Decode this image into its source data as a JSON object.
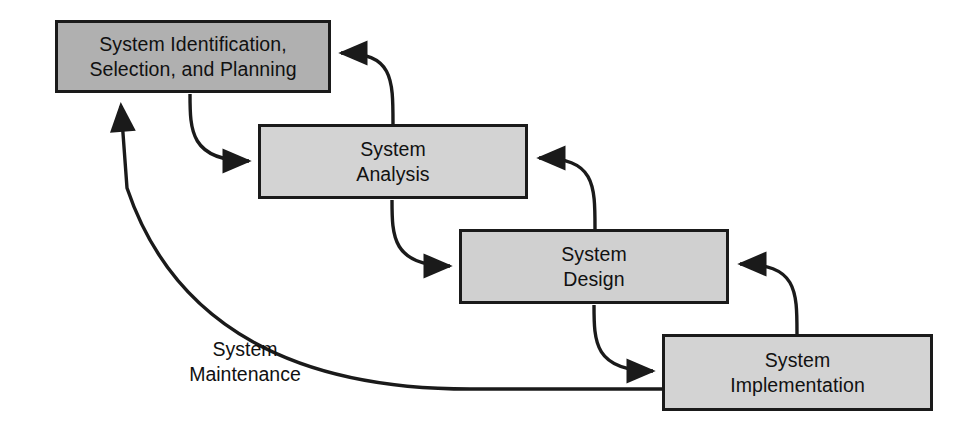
{
  "diagram": {
    "type": "flow-diagram",
    "background_color": "#ffffff",
    "stroke_color": "#1a1a1a",
    "nodes": [
      {
        "id": "identification",
        "label": "System Identification,\nSelection, and Planning",
        "fill": "#b0b0b0",
        "x": 55,
        "y": 20,
        "width": 276,
        "height": 73
      },
      {
        "id": "analysis",
        "label": "System\nAnalysis",
        "fill": "#d3d3d3",
        "x": 258,
        "y": 124,
        "width": 270,
        "height": 75
      },
      {
        "id": "design",
        "label": "System\nDesign",
        "fill": "#d0d0d0",
        "x": 459,
        "y": 229,
        "width": 270,
        "height": 75
      },
      {
        "id": "implementation",
        "label": "System\nImplementation",
        "fill": "#d3d3d3",
        "x": 662,
        "y": 334,
        "width": 271,
        "height": 77
      }
    ],
    "edge_labels": [
      {
        "id": "maintenance",
        "label": "System\nMaintenance",
        "x": 150,
        "y": 337
      }
    ],
    "edges": [
      {
        "id": "forward-identification-analysis",
        "from": "identification",
        "to": "analysis",
        "direction": "forward"
      },
      {
        "id": "backward-analysis-identification",
        "from": "analysis",
        "to": "identification",
        "direction": "backward"
      },
      {
        "id": "forward-analysis-design",
        "from": "analysis",
        "to": "design",
        "direction": "forward"
      },
      {
        "id": "backward-design-analysis",
        "from": "design",
        "to": "analysis",
        "direction": "backward"
      },
      {
        "id": "forward-design-implementation",
        "from": "design",
        "to": "implementation",
        "direction": "forward"
      },
      {
        "id": "backward-implementation-design",
        "from": "implementation",
        "to": "design",
        "direction": "backward"
      },
      {
        "id": "maintenance-implementation-identification",
        "from": "implementation",
        "to": "identification",
        "direction": "feedback"
      }
    ]
  }
}
